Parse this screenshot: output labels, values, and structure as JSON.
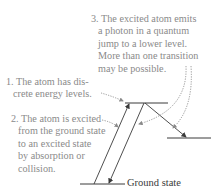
{
  "diagram": {
    "steps": [
      {
        "number": "1.",
        "lines": [
          "The atom has dis-",
          "crete energy levels."
        ]
      },
      {
        "number": "2.",
        "lines": [
          "The atom is excited",
          "from the ground state",
          "to an excited state",
          "by absorption or",
          "collision."
        ]
      },
      {
        "number": "3.",
        "lines": [
          "The excited atom emits",
          "a photon in a quantum",
          "jump to a lower level.",
          "More than one transition",
          "may be possible."
        ]
      }
    ],
    "levels": {
      "ground": "Ground state"
    },
    "colors": {
      "annotation_text": "#8a8a8a",
      "lines": "#3a3a3a",
      "dotted_leaders": "#8a8a8a"
    }
  }
}
